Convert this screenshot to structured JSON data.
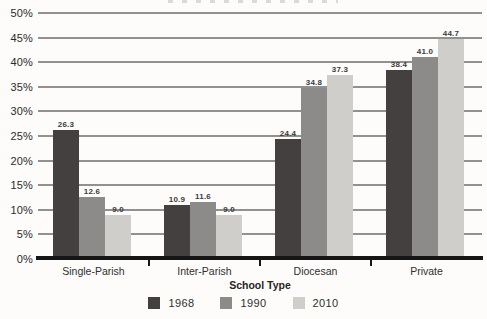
{
  "chart_data": {
    "type": "bar",
    "title": "",
    "xlabel": "School Type",
    "ylabel": "",
    "ylim": [
      0,
      50
    ],
    "y_tick_step": 5,
    "y_tick_labels": [
      "0%",
      "5%",
      "10%",
      "15%",
      "20%",
      "25%",
      "30%",
      "35%",
      "40%",
      "45%",
      "50%"
    ],
    "grid": "horizontal",
    "legend_position": "bottom",
    "categories": [
      "Single-Parish",
      "Inter-Parish",
      "Diocesan",
      "Private"
    ],
    "series": [
      {
        "name": "1968",
        "color": "#454040",
        "values": [
          26.3,
          10.9,
          24.4,
          38.4
        ],
        "labels": [
          "26.3",
          "10.9",
          "24.4",
          "38.4"
        ]
      },
      {
        "name": "1990",
        "color": "#8d8a8a",
        "values": [
          12.6,
          11.6,
          34.8,
          41.0
        ],
        "labels": [
          "12.6",
          "11.6",
          "34.8",
          "41.0"
        ]
      },
      {
        "name": "2010",
        "color": "#cfcecb",
        "values": [
          9.0,
          9.0,
          37.3,
          44.7
        ],
        "labels": [
          "9.0",
          "9.0",
          "37.3",
          "44.7"
        ]
      }
    ],
    "colors": {
      "gridline": "#919191",
      "axis": "#161616",
      "value_label": "#3c3c3c",
      "background": "#fdfcfa"
    }
  }
}
